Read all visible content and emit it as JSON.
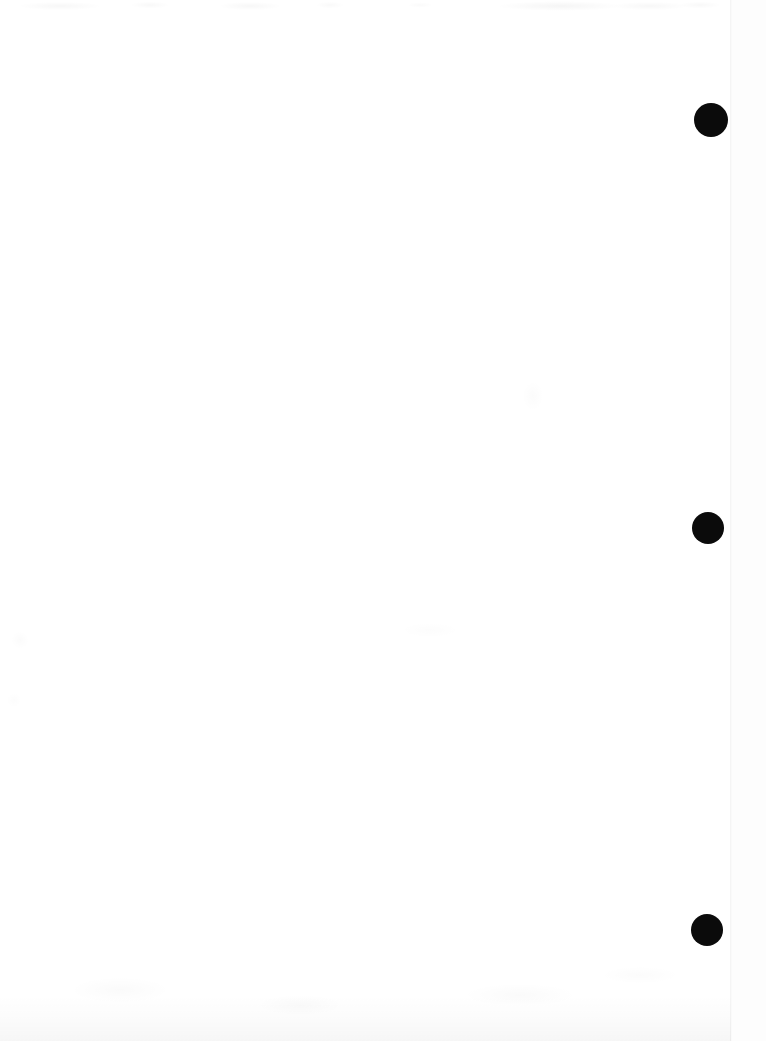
{
  "page": {
    "kind": "scanned-document-page",
    "content_text": "",
    "background_color": "#ffffff",
    "width": 766,
    "height": 1041
  },
  "sheet": {
    "name": "paper-sheet",
    "color": "#ffffff",
    "left": 0,
    "top": 0,
    "width": 731,
    "height": 1041
  },
  "backing": {
    "name": "scanner-backing",
    "color": "#fdfdfd",
    "left": 731,
    "width": 35
  },
  "edge": {
    "name": "sheet-edge",
    "left": 730,
    "color": "#000000"
  },
  "marks": {
    "label": "binder-hole-marks",
    "color": "#0b0b0b",
    "items": [
      {
        "id": "punch-mark-top",
        "cx": 711,
        "cy": 120,
        "r": 17
      },
      {
        "id": "punch-mark-middle",
        "cx": 708,
        "cy": 528,
        "r": 16
      },
      {
        "id": "punch-mark-bottom",
        "cx": 707,
        "cy": 930,
        "r": 16
      }
    ]
  },
  "artifacts": {
    "bleed_band": {
      "name": "top-bleed-through-band",
      "height": 16
    },
    "bottom_shade": {
      "name": "bottom-gray-wash",
      "height": 46
    },
    "smudges": {
      "name": "scan-smudge-field"
    }
  }
}
